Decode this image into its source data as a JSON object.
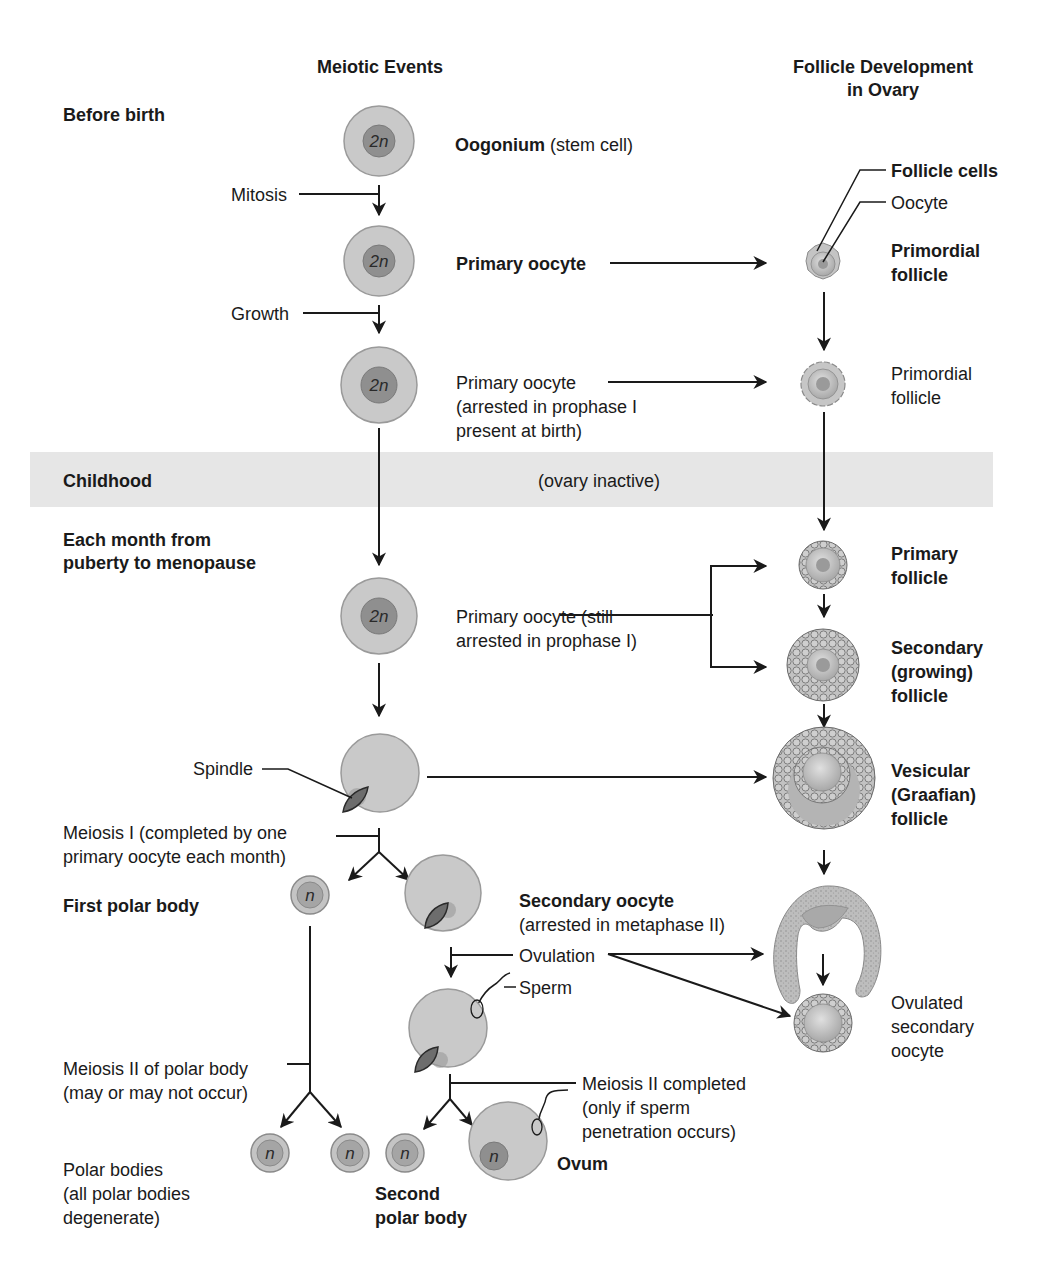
{
  "headers": {
    "meiotic_events": "Meiotic Events",
    "follicle_line1": "Follicle Development",
    "follicle_line2": "in Ovary"
  },
  "stages": {
    "before_birth": "Before birth",
    "childhood": "Childhood",
    "ovary_inactive": "(ovary inactive)",
    "monthly_line1": "Each month from",
    "monthly_line2": "puberty to menopause"
  },
  "processes": {
    "mitosis": "Mitosis",
    "growth": "Growth",
    "spindle": "Spindle",
    "meiosis1_line1": "Meiosis I (completed by one",
    "meiosis1_line2": "primary oocyte each month)",
    "ovulation": "Ovulation",
    "sperm": "Sperm",
    "meiosis2_polar_line1": "Meiosis II of polar body",
    "meiosis2_polar_line2": "(may or may not occur)",
    "meiosis2_done_line1": "Meiosis II completed",
    "meiosis2_done_line2": "(only if sperm",
    "meiosis2_done_line3": "penetration occurs)"
  },
  "cells": {
    "oogonium_bold": "Oogonium",
    "oogonium_note": " (stem cell)",
    "primary_oocyte_bold": "Primary oocyte",
    "primary_arrested_line1": "Primary oocyte",
    "primary_arrested_line2": "(arrested in prophase I",
    "primary_arrested_line3": "present at birth)",
    "primary_still_line1": "Primary oocyte (still",
    "primary_still_line2": "arrested in prophase I)",
    "first_polar_body": "First polar body",
    "secondary_oocyte": "Secondary oocyte",
    "secondary_oocyte_note": "(arrested in metaphase II)",
    "polar_bodies_line1": "Polar bodies",
    "polar_bodies_line2": "(all polar bodies",
    "polar_bodies_line3": "degenerate)",
    "second_polar_line1": "Second",
    "second_polar_line2": "polar body",
    "ovum": "Ovum"
  },
  "follicles": {
    "follicle_cells": "Follicle cells",
    "oocyte": "Oocyte",
    "primordial_bold_line1": "Primordial",
    "primordial_bold_line2": "follicle",
    "primordial_line1": "Primordial",
    "primordial_line2": "follicle",
    "primary_line1": "Primary",
    "primary_line2": "follicle",
    "secondary_line1": "Secondary",
    "secondary_line2": "(growing)",
    "secondary_line3": "follicle",
    "vesicular_line1": "Vesicular",
    "vesicular_line2": "(Graafian)",
    "vesicular_line3": "follicle",
    "ovulated_line1": "Ovulated",
    "ovulated_line2": "secondary",
    "ovulated_line3": "oocyte"
  },
  "ploidy": {
    "diploid": "2n",
    "haploid": "n"
  },
  "colors": {
    "cell_fill": "#c9c9c9",
    "nucleus_fill": "#8f8f8f",
    "band_fill": "#e6e6e6",
    "ink": "#1a1a1a"
  }
}
